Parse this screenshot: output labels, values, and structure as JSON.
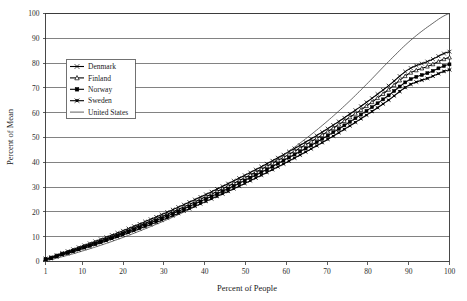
{
  "chart_data": {
    "type": "line",
    "title": "",
    "xlabel": "Percent of People",
    "ylabel": "Percent of Mean",
    "xlim": [
      1,
      100
    ],
    "ylim": [
      0,
      100
    ],
    "grid": true,
    "legend_position": "upper-left-inside",
    "x_ticks": [
      "1",
      "10",
      "20",
      "30",
      "40",
      "50",
      "60",
      "70",
      "80",
      "90",
      "100"
    ],
    "x_tick_values": [
      1,
      10,
      20,
      30,
      40,
      50,
      60,
      70,
      80,
      90,
      100
    ],
    "y_ticks": [
      "0",
      "10",
      "20",
      "30",
      "40",
      "50",
      "60",
      "70",
      "80",
      "90",
      "100"
    ],
    "y_tick_values": [
      0,
      10,
      20,
      30,
      40,
      50,
      60,
      70,
      80,
      90,
      100
    ],
    "x": [
      1,
      5,
      10,
      15,
      20,
      25,
      30,
      35,
      40,
      45,
      50,
      55,
      60,
      65,
      70,
      75,
      80,
      85,
      90,
      95,
      100
    ],
    "series": [
      {
        "name": "Denmark",
        "marker": "cross",
        "values": [
          1.2,
          3.4,
          6.2,
          9.2,
          12.4,
          15.8,
          19.3,
          23.0,
          26.8,
          30.8,
          34.9,
          39.2,
          43.7,
          48.4,
          53.4,
          58.8,
          64.6,
          70.8,
          77.5,
          80.9,
          84.6
        ]
      },
      {
        "name": "Finland",
        "marker": "triangle-open",
        "values": [
          1.0,
          3.1,
          5.8,
          8.7,
          11.8,
          15.1,
          18.5,
          22.1,
          25.9,
          29.8,
          33.9,
          38.2,
          42.6,
          47.3,
          52.2,
          57.5,
          63.1,
          69.2,
          75.7,
          78.9,
          82.3
        ]
      },
      {
        "name": "Norway",
        "marker": "square-filled",
        "values": [
          0.9,
          2.9,
          5.5,
          8.3,
          11.3,
          14.5,
          17.8,
          21.3,
          25.0,
          28.8,
          32.8,
          36.9,
          41.3,
          45.8,
          50.6,
          55.7,
          61.1,
          66.9,
          73.1,
          76.2,
          79.5
        ]
      },
      {
        "name": "Sweden",
        "marker": "cross-bar",
        "values": [
          0.7,
          2.6,
          5.1,
          7.8,
          10.7,
          13.8,
          17.0,
          20.4,
          24.0,
          27.7,
          31.6,
          35.7,
          39.9,
          44.4,
          49.1,
          54.1,
          59.4,
          65.0,
          71.0,
          74.1,
          77.3
        ]
      },
      {
        "name": "United States",
        "marker": "none",
        "values": [
          0.4,
          1.9,
          4.2,
          6.8,
          9.7,
          12.9,
          16.3,
          20.0,
          24.0,
          28.3,
          33.0,
          38.1,
          43.7,
          49.8,
          56.5,
          63.9,
          72.0,
          80.5,
          88.5,
          95.0,
          100.0
        ]
      }
    ]
  },
  "legend": {
    "items": [
      {
        "label": "Denmark",
        "marker": "cross"
      },
      {
        "label": "Finland",
        "marker": "triangle-open"
      },
      {
        "label": "Norway",
        "marker": "square-filled"
      },
      {
        "label": "Sweden",
        "marker": "cross-bar"
      },
      {
        "label": "United States",
        "marker": "none"
      }
    ]
  },
  "axes": {
    "x_title": "Percent of People",
    "y_title": "Percent of Mean"
  }
}
